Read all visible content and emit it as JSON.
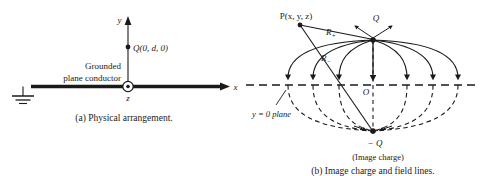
{
  "figure": {
    "type": "physics-diagram",
    "topic": "Method of images: point charge above grounded conducting plane",
    "panels": [
      {
        "id": "a",
        "caption": "(a)  Physical arrangement.",
        "labels": {
          "y_axis": "y",
          "x_axis": "x",
          "z_axis": "z",
          "charge": "Q(0, d, 0)",
          "conductor_line1": "Grounded",
          "conductor_line2": "plane conductor"
        }
      },
      {
        "id": "b",
        "caption": "(b)  Image charge and field lines.",
        "labels": {
          "field_point": "P(x, y, z)",
          "distance_plus": "R",
          "distance_plus_sub": "+",
          "distance_minus": "R",
          "distance_minus_sub": "−",
          "charge_positive": "Q",
          "charge_negative": "− Q",
          "origin": "O",
          "plane": "y = 0 plane",
          "image_note": "(Image charge)"
        }
      }
    ],
    "colors": {
      "ink": "#1a1a1a",
      "background": "#ffffff",
      "dashed": "#2a2a2a"
    }
  }
}
